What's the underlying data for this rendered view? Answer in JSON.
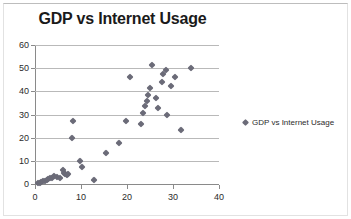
{
  "chart_data": {
    "type": "scatter",
    "title": "GDP vs Internet Usage",
    "xlabel": "",
    "ylabel": "",
    "xlim": [
      0,
      40
    ],
    "ylim": [
      0,
      60
    ],
    "xticks": [
      0,
      10,
      20,
      30,
      40
    ],
    "yticks": [
      0,
      10,
      20,
      30,
      40,
      50,
      60
    ],
    "grid": "horizontal",
    "legend_position": "right",
    "marker": "diamond",
    "marker_color": "#6b6b78",
    "series": [
      {
        "name": "GDP vs Internet Usage",
        "points": [
          [
            0.7,
            0.4
          ],
          [
            1.1,
            0.6
          ],
          [
            1.4,
            0.9
          ],
          [
            1.8,
            1.1
          ],
          [
            2.1,
            1.4
          ],
          [
            2.5,
            1.7
          ],
          [
            2.9,
            2.0
          ],
          [
            3.3,
            2.4
          ],
          [
            3.7,
            2.8
          ],
          [
            4.2,
            3.5
          ],
          [
            4.8,
            3.2
          ],
          [
            5.4,
            2.6
          ],
          [
            6.0,
            6.0
          ],
          [
            6.3,
            4.6
          ],
          [
            6.6,
            4.2
          ],
          [
            6.9,
            4.0
          ],
          [
            7.2,
            4.4
          ],
          [
            8.1,
            20.0
          ],
          [
            8.3,
            27.0
          ],
          [
            9.8,
            10.0
          ],
          [
            10.3,
            7.5
          ],
          [
            12.9,
            1.6
          ],
          [
            15.5,
            13.5
          ],
          [
            18.2,
            17.5
          ],
          [
            19.8,
            27.0
          ],
          [
            20.6,
            46.0
          ],
          [
            23.0,
            26.0
          ],
          [
            23.5,
            30.5
          ],
          [
            24.0,
            33.5
          ],
          [
            24.3,
            36.0
          ],
          [
            24.6,
            38.5
          ],
          [
            25.0,
            41.5
          ],
          [
            25.4,
            51.5
          ],
          [
            26.2,
            37.0
          ],
          [
            26.8,
            33.0
          ],
          [
            27.5,
            44.0
          ],
          [
            27.9,
            47.5
          ],
          [
            28.4,
            49.0
          ],
          [
            28.8,
            30.0
          ],
          [
            29.6,
            42.5
          ],
          [
            30.5,
            46.0
          ],
          [
            31.8,
            23.5
          ],
          [
            34.0,
            50.0
          ]
        ]
      }
    ]
  },
  "legend": {
    "entries": [
      {
        "label": "GDP vs Internet Usage",
        "color": "#6b6b78"
      }
    ]
  }
}
